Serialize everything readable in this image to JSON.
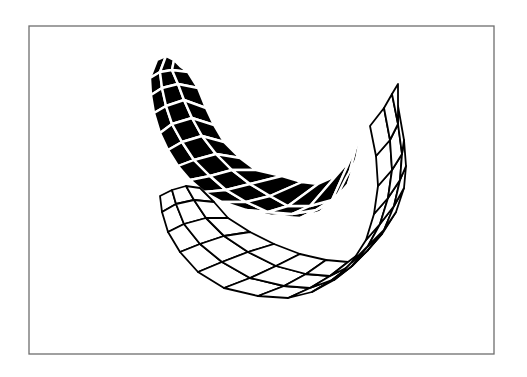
{
  "figure": {
    "width": 527,
    "height": 377,
    "frame": {
      "x": 29,
      "y": 26,
      "w": 465,
      "h": 328,
      "color": "#6e6e6e"
    },
    "colors": {
      "background": "#ffffff",
      "ink": "#000000"
    }
  },
  "meshes": {
    "back_banana": {
      "style": "solid-black-with-white-edges",
      "rows": [
        [
          [
            157,
            60
          ],
          [
            166,
            56
          ],
          [
            174,
            60
          ],
          [
            180,
            66
          ]
        ],
        [
          [
            150,
            78
          ],
          [
            160,
            72
          ],
          [
            172,
            70
          ],
          [
            188,
            72
          ]
        ],
        [
          [
            151,
            95
          ],
          [
            162,
            88
          ],
          [
            178,
            84
          ],
          [
            198,
            88
          ]
        ],
        [
          [
            154,
            113
          ],
          [
            166,
            106
          ],
          [
            184,
            100
          ],
          [
            206,
            108
          ]
        ],
        [
          [
            160,
            133
          ],
          [
            172,
            124
          ],
          [
            192,
            118
          ],
          [
            214,
            125
          ]
        ],
        [
          [
            168,
            150
          ],
          [
            182,
            142
          ],
          [
            202,
            136
          ],
          [
            224,
            142
          ]
        ],
        [
          [
            178,
            166
          ],
          [
            194,
            160
          ],
          [
            216,
            154
          ],
          [
            240,
            158
          ]
        ],
        [
          [
            190,
            180
          ],
          [
            210,
            176
          ],
          [
            232,
            170
          ],
          [
            256,
            170
          ]
        ],
        [
          [
            204,
            192
          ],
          [
            226,
            190
          ],
          [
            250,
            184
          ],
          [
            282,
            176
          ]
        ],
        [
          [
            222,
            202
          ],
          [
            246,
            202
          ],
          [
            270,
            196
          ],
          [
            302,
            182
          ]
        ],
        [
          [
            246,
            210
          ],
          [
            268,
            212
          ],
          [
            288,
            206
          ],
          [
            318,
            184
          ]
        ],
        [
          [
            272,
            216
          ],
          [
            292,
            214
          ],
          [
            310,
            206
          ],
          [
            336,
            176
          ]
        ],
        [
          [
            300,
            218
          ],
          [
            316,
            210
          ],
          [
            332,
            200
          ],
          [
            350,
            160
          ]
        ],
        [
          [
            320,
            212
          ],
          [
            334,
            202
          ],
          [
            346,
            186
          ],
          [
            358,
            140
          ]
        ],
        [
          [
            336,
            198
          ],
          [
            348,
            184
          ],
          [
            356,
            162
          ],
          [
            364,
            118
          ]
        ],
        [
          [
            346,
            178
          ],
          [
            356,
            160
          ],
          [
            362,
            136
          ],
          [
            370,
            100
          ]
        ]
      ]
    },
    "front_banana": {
      "style": "white-with-black-edges",
      "rows": [
        [
          [
            160,
            196
          ],
          [
            172,
            190
          ],
          [
            186,
            186
          ],
          [
            200,
            188
          ]
        ],
        [
          [
            162,
            212
          ],
          [
            176,
            204
          ],
          [
            194,
            200
          ],
          [
            214,
            202
          ]
        ],
        [
          [
            168,
            232
          ],
          [
            184,
            224
          ],
          [
            206,
            218
          ],
          [
            228,
            218
          ]
        ],
        [
          [
            180,
            252
          ],
          [
            200,
            244
          ],
          [
            224,
            236
          ],
          [
            250,
            232
          ]
        ],
        [
          [
            198,
            272
          ],
          [
            222,
            262
          ],
          [
            248,
            252
          ],
          [
            274,
            244
          ]
        ],
        [
          [
            224,
            288
          ],
          [
            250,
            278
          ],
          [
            276,
            266
          ],
          [
            300,
            254
          ]
        ],
        [
          [
            258,
            296
          ],
          [
            284,
            286
          ],
          [
            306,
            274
          ],
          [
            326,
            260
          ]
        ],
        [
          [
            288,
            298
          ],
          [
            310,
            288
          ],
          [
            330,
            276
          ],
          [
            348,
            262
          ]
        ],
        [
          [
            312,
            292
          ],
          [
            332,
            280
          ],
          [
            350,
            266
          ],
          [
            364,
            250
          ]
        ],
        [
          [
            334,
            280
          ],
          [
            352,
            266
          ],
          [
            368,
            250
          ],
          [
            382,
            234
          ]
        ],
        [
          [
            352,
            262
          ],
          [
            368,
            246
          ],
          [
            384,
            230
          ],
          [
            396,
            212
          ]
        ],
        [
          [
            366,
            240
          ],
          [
            380,
            224
          ],
          [
            394,
            206
          ],
          [
            404,
            188
          ]
        ],
        [
          [
            374,
            214
          ],
          [
            388,
            198
          ],
          [
            400,
            180
          ],
          [
            406,
            166
          ]
        ],
        [
          [
            378,
            186
          ],
          [
            392,
            170
          ],
          [
            402,
            154
          ],
          [
            404,
            140
          ]
        ],
        [
          [
            376,
            156
          ],
          [
            390,
            140
          ],
          [
            398,
            124
          ],
          [
            398,
            106
          ]
        ],
        [
          [
            370,
            126
          ],
          [
            384,
            108
          ],
          [
            392,
            94
          ],
          [
            398,
            84
          ]
        ]
      ]
    }
  }
}
